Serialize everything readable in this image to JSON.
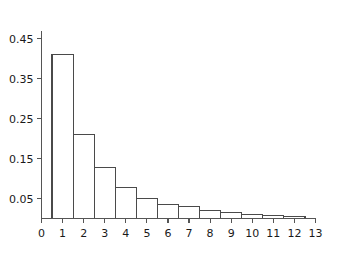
{
  "chart_data": {
    "type": "bar",
    "title": "",
    "subtitle": "",
    "xlabel": "",
    "ylabel": "",
    "categories": [
      "1",
      "2",
      "3",
      "4",
      "5",
      "6",
      "7",
      "8",
      "9",
      "10",
      "11",
      "12"
    ],
    "values": [
      0.41,
      0.21,
      0.128,
      0.077,
      0.051,
      0.036,
      0.029,
      0.021,
      0.015,
      0.011,
      0.008,
      0.005
    ],
    "xlim": [
      0,
      13
    ],
    "ylim": [
      0,
      0.47
    ],
    "x_ticks": [
      "0",
      "1",
      "2",
      "3",
      "4",
      "5",
      "6",
      "7",
      "8",
      "9",
      "10",
      "11",
      "12",
      "13"
    ],
    "x_tick_values": [
      0,
      1,
      2,
      3,
      4,
      5,
      6,
      7,
      8,
      9,
      10,
      11,
      12,
      13
    ],
    "y_ticks": [
      "0.05",
      "0.15",
      "0.25",
      "0.35",
      "0.45"
    ],
    "y_tick_values": [
      0.05,
      0.15,
      0.25,
      0.35,
      0.45
    ],
    "grid": false,
    "legend": null,
    "legend_position": "none",
    "bar_width": 1,
    "bar_fill": "#ffffff",
    "bar_stroke": "#4a4a4a",
    "axis_color": "#555555",
    "background": "#ffffff",
    "annotations": []
  }
}
